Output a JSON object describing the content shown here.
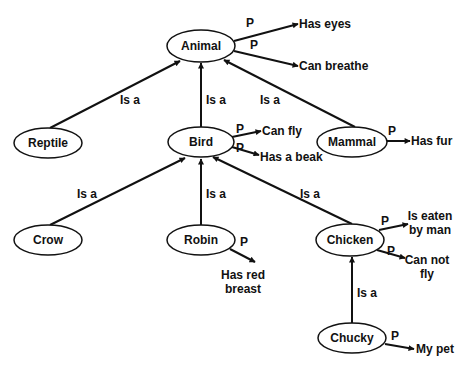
{
  "diagram": {
    "type": "semantic-network",
    "nodes": [
      {
        "id": "animal",
        "label": "Animal",
        "cx": 201,
        "cy": 46,
        "rx": 34,
        "ry": 16
      },
      {
        "id": "reptile",
        "label": "Reptile",
        "cx": 48,
        "cy": 143,
        "rx": 34,
        "ry": 15
      },
      {
        "id": "bird",
        "label": "Bird",
        "cx": 201,
        "cy": 142,
        "rx": 33,
        "ry": 15
      },
      {
        "id": "mammal",
        "label": "Mammal",
        "cx": 352,
        "cy": 142,
        "rx": 35,
        "ry": 15
      },
      {
        "id": "crow",
        "label": "Crow",
        "cx": 48,
        "cy": 240,
        "rx": 34,
        "ry": 15
      },
      {
        "id": "robin",
        "label": "Robin",
        "cx": 201,
        "cy": 240,
        "rx": 34,
        "ry": 15
      },
      {
        "id": "chicken",
        "label": "Chicken",
        "cx": 350,
        "cy": 240,
        "rx": 34,
        "ry": 16
      },
      {
        "id": "chucky",
        "label": "Chucky",
        "cx": 352,
        "cy": 338,
        "rx": 34,
        "ry": 15
      }
    ],
    "isa_edges": [
      {
        "from": "reptile",
        "to": "animal",
        "label": "Is a",
        "x1": 50,
        "y1": 128,
        "x2": 180,
        "y2": 61,
        "lx": 120,
        "ly": 104
      },
      {
        "from": "bird",
        "to": "animal",
        "label": "Is a",
        "x1": 201,
        "y1": 127,
        "x2": 201,
        "y2": 63,
        "lx": 206,
        "ly": 104
      },
      {
        "from": "mammal",
        "to": "animal",
        "label": "Is a",
        "x1": 355,
        "y1": 127,
        "x2": 224,
        "y2": 60,
        "lx": 260,
        "ly": 104
      },
      {
        "from": "crow",
        "to": "bird",
        "label": "Is a",
        "x1": 50,
        "y1": 225,
        "x2": 185,
        "y2": 158,
        "lx": 77,
        "ly": 198
      },
      {
        "from": "robin",
        "to": "bird",
        "label": "Is a",
        "x1": 201,
        "y1": 225,
        "x2": 201,
        "y2": 159,
        "lx": 206,
        "ly": 198
      },
      {
        "from": "chicken",
        "to": "bird",
        "label": "Is a",
        "x1": 352,
        "y1": 224,
        "x2": 213,
        "y2": 157,
        "lx": 300,
        "ly": 198
      },
      {
        "from": "chucky",
        "to": "chicken",
        "label": "Is a",
        "x1": 352,
        "y1": 323,
        "x2": 352,
        "y2": 257,
        "lx": 357,
        "ly": 297
      }
    ],
    "property_edges": [
      {
        "from": "animal",
        "label": "P",
        "target": "Has eyes",
        "x1": 234,
        "y1": 41,
        "x2": 298,
        "y2": 24,
        "px": 246,
        "py": 27,
        "tx": 299,
        "ty": 28,
        "tlines": [
          "Has eyes"
        ]
      },
      {
        "from": "animal",
        "label": "P",
        "target": "Can breathe",
        "x1": 234,
        "y1": 51,
        "x2": 298,
        "y2": 66,
        "px": 250,
        "py": 49,
        "tx": 299,
        "ty": 70,
        "tlines": [
          "Can breathe"
        ]
      },
      {
        "from": "bird",
        "label": "P",
        "target": "Can fly",
        "x1": 232,
        "y1": 137,
        "x2": 261,
        "y2": 131,
        "px": 236,
        "py": 133,
        "tx": 262,
        "ty": 135,
        "tlines": [
          "Can fly"
        ]
      },
      {
        "from": "bird",
        "label": "P",
        "target": "Has a beak",
        "x1": 232,
        "y1": 147,
        "x2": 259,
        "y2": 155,
        "px": 236,
        "py": 152,
        "tx": 260,
        "ty": 161,
        "tlines": [
          "Has a beak"
        ]
      },
      {
        "from": "mammal",
        "label": "P",
        "target": "Has fur",
        "x1": 387,
        "y1": 141,
        "x2": 410,
        "y2": 141,
        "px": 388,
        "py": 135,
        "tx": 411,
        "ty": 145,
        "tlines": [
          "Has fur"
        ]
      },
      {
        "from": "robin",
        "label": "P",
        "target": "Has red breast",
        "x1": 230,
        "y1": 249,
        "x2": 255,
        "y2": 262,
        "px": 240,
        "py": 246,
        "tlines": [
          "Has red",
          "breast"
        ],
        "tx": 243,
        "ty": 279
      },
      {
        "from": "chicken",
        "label": "P",
        "target": "Is eaten by man",
        "x1": 379,
        "y1": 230,
        "x2": 408,
        "y2": 224,
        "px": 381,
        "py": 225,
        "tlines": [
          "Is eaten",
          "by man"
        ],
        "tx": 430,
        "ty": 220
      },
      {
        "from": "chicken",
        "label": "P",
        "target": "Can not fly",
        "x1": 377,
        "y1": 250,
        "x2": 405,
        "y2": 258,
        "px": 387,
        "py": 255,
        "tlines": [
          "Can not",
          "fly"
        ],
        "tx": 427,
        "ty": 264
      },
      {
        "from": "chucky",
        "label": "P",
        "target": "My pet",
        "x1": 385,
        "y1": 344,
        "x2": 414,
        "y2": 349,
        "px": 391,
        "py": 340,
        "tx": 416,
        "ty": 353,
        "tlines": [
          "My pet"
        ]
      }
    ]
  }
}
